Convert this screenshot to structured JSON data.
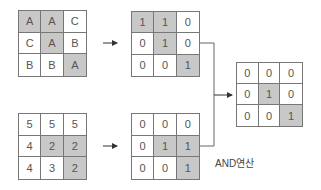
{
  "diagram": {
    "grids": [
      {
        "id": "input-categorical",
        "cells": [
          "A",
          "A",
          "C",
          "C",
          "A",
          "B",
          "B",
          "B",
          "A"
        ],
        "highlight": [
          true,
          true,
          false,
          false,
          true,
          false,
          false,
          false,
          true
        ]
      },
      {
        "id": "binary-top",
        "cells": [
          "1",
          "1",
          "0",
          "0",
          "1",
          "0",
          "0",
          "0",
          "1"
        ],
        "highlight": [
          true,
          true,
          false,
          false,
          true,
          false,
          false,
          false,
          true
        ]
      },
      {
        "id": "input-numeric",
        "cells": [
          "5",
          "5",
          "5",
          "4",
          "2",
          "2",
          "4",
          "3",
          "2"
        ],
        "highlight": [
          false,
          false,
          false,
          false,
          true,
          true,
          false,
          false,
          true
        ]
      },
      {
        "id": "binary-bottom",
        "cells": [
          "0",
          "0",
          "0",
          "0",
          "1",
          "1",
          "0",
          "0",
          "1"
        ],
        "highlight": [
          false,
          false,
          false,
          false,
          true,
          true,
          false,
          false,
          true
        ]
      },
      {
        "id": "result",
        "cells": [
          "0",
          "0",
          "0",
          "0",
          "1",
          "0",
          "0",
          "0",
          "1"
        ],
        "highlight": [
          false,
          false,
          false,
          false,
          true,
          false,
          false,
          false,
          true
        ]
      }
    ],
    "operation_label": "AND연산",
    "colors": {
      "highlight": "#c8c8c8",
      "border": "#777777",
      "line": "#666666"
    }
  }
}
